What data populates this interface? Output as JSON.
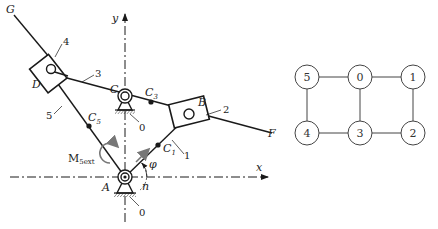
{
  "mechanism": {
    "axes": {
      "x_label": "x",
      "y_label": "y"
    },
    "points": {
      "A": "A",
      "B": "B",
      "C": "C",
      "D": "D",
      "F": "F",
      "G": "G",
      "C1": "C",
      "C1_sub": "1",
      "C3": "C",
      "C3_sub": "3",
      "C5": "C",
      "C5_sub": "5"
    },
    "links": {
      "l0_top": "0",
      "l0_bottom": "0",
      "l1": "1",
      "l2": "2",
      "l3": "3",
      "l4": "4",
      "l5": "5"
    },
    "angle_phi": "φ",
    "angle_n": "n",
    "moment": "M",
    "moment_sub": "5ext"
  },
  "graph": {
    "nodes": [
      {
        "id": "5",
        "label": "5"
      },
      {
        "id": "0",
        "label": "0"
      },
      {
        "id": "1",
        "label": "1"
      },
      {
        "id": "4",
        "label": "4"
      },
      {
        "id": "3",
        "label": "3"
      },
      {
        "id": "2",
        "label": "2"
      }
    ],
    "edges": [
      [
        "5",
        "0"
      ],
      [
        "0",
        "1"
      ],
      [
        "5",
        "4"
      ],
      [
        "0",
        "3"
      ],
      [
        "1",
        "2"
      ],
      [
        "4",
        "3"
      ],
      [
        "3",
        "2"
      ]
    ]
  },
  "colors": {
    "line": "#1a1a1a",
    "arrow_gray": "#777777",
    "node_stroke": "#444444"
  }
}
